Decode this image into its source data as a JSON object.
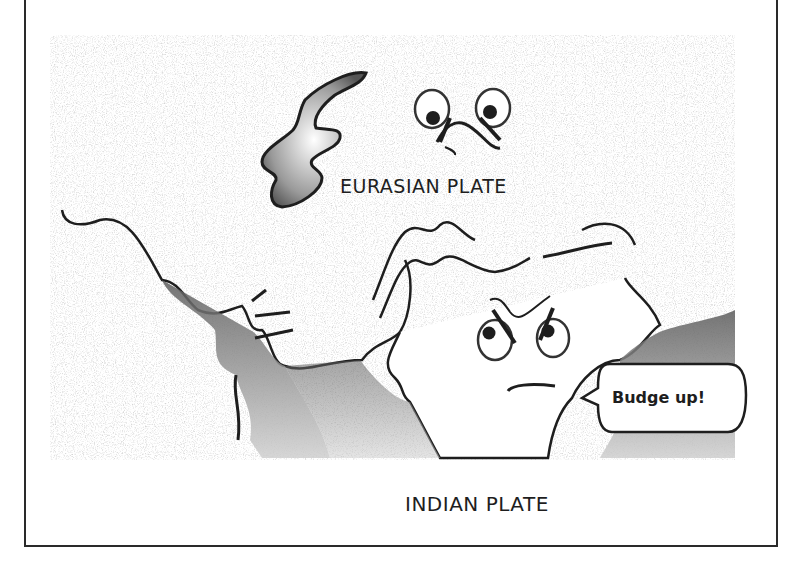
{
  "illustration": {
    "title": "Tectonic plate collision cartoon",
    "labels": {
      "eurasian_plate": "EURASIAN PLATE",
      "indian_plate": "INDIAN PLATE"
    },
    "speech_bubble": {
      "speaker": "indian-plate-character",
      "text": "Budge up!"
    },
    "characters": [
      {
        "name": "eurasian-plate-face",
        "expression": "worried, looking down"
      },
      {
        "name": "indian-plate-face",
        "expression": "frowning, pushing upward"
      }
    ],
    "colors": {
      "ink": "#1e1e1e",
      "shade": "#7a7a7a",
      "paper": "#ffffff",
      "stipple": "#bdbdbd"
    }
  }
}
